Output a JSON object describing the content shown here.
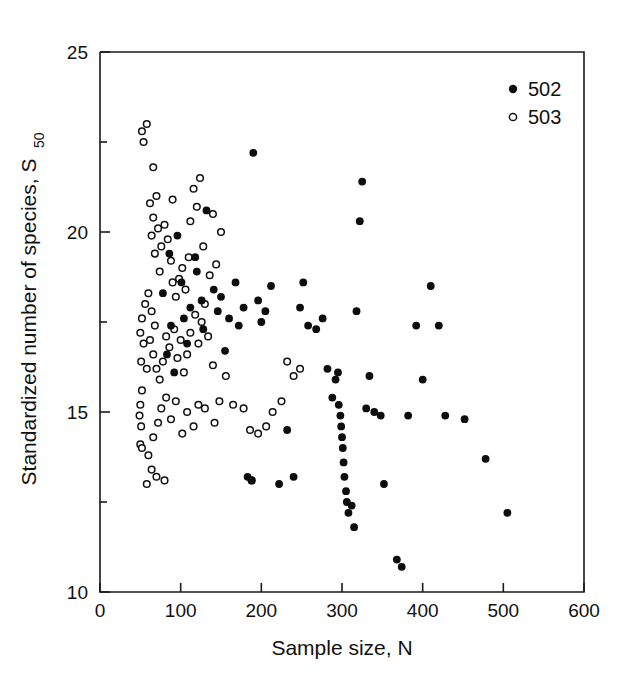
{
  "chart_data": {
    "type": "scatter",
    "title": "",
    "xlabel": "Sample size, N",
    "ylabel_main": "Standardized number of species, S",
    "ylabel_sub": "50",
    "xlim": [
      0,
      600
    ],
    "ylim": [
      10,
      25
    ],
    "xticks": [
      0,
      100,
      200,
      300,
      400,
      500,
      600
    ],
    "yticks": [
      10,
      15,
      20,
      25
    ],
    "yticks_minor": [
      12.5,
      17.5,
      22.5
    ],
    "grid": false,
    "legend_position": "top-right",
    "series": [
      {
        "name": "502",
        "marker": "filled-circle",
        "color": "#0d0d0d",
        "points": [
          [
            118,
            19.3
          ],
          [
            120,
            18.9
          ],
          [
            126,
            18.1
          ],
          [
            128,
            17.3
          ],
          [
            132,
            20.6
          ],
          [
            96,
            19.9
          ],
          [
            101,
            18.6
          ],
          [
            104,
            17.6
          ],
          [
            108,
            16.9
          ],
          [
            112,
            17.9
          ],
          [
            88,
            17.4
          ],
          [
            83,
            16.6
          ],
          [
            92,
            16.1
          ],
          [
            78,
            18.3
          ],
          [
            86,
            19.4
          ],
          [
            141,
            18.4
          ],
          [
            146,
            17.8
          ],
          [
            150,
            18.2
          ],
          [
            155,
            16.7
          ],
          [
            160,
            17.6
          ],
          [
            168,
            18.6
          ],
          [
            172,
            17.4
          ],
          [
            178,
            17.9
          ],
          [
            183,
            13.2
          ],
          [
            188,
            13.1
          ],
          [
            190,
            22.2
          ],
          [
            196,
            18.1
          ],
          [
            200,
            17.5
          ],
          [
            205,
            17.8
          ],
          [
            212,
            18.5
          ],
          [
            222,
            13.0
          ],
          [
            232,
            14.5
          ],
          [
            240,
            13.2
          ],
          [
            248,
            17.9
          ],
          [
            252,
            18.6
          ],
          [
            258,
            17.4
          ],
          [
            268,
            17.3
          ],
          [
            276,
            17.6
          ],
          [
            282,
            16.2
          ],
          [
            288,
            15.4
          ],
          [
            292,
            15.9
          ],
          [
            295,
            16.1
          ],
          [
            296,
            15.2
          ],
          [
            298,
            14.9
          ],
          [
            299,
            14.6
          ],
          [
            300,
            14.3
          ],
          [
            301,
            14.0
          ],
          [
            302,
            13.6
          ],
          [
            303,
            13.2
          ],
          [
            305,
            12.8
          ],
          [
            306,
            12.5
          ],
          [
            308,
            12.2
          ],
          [
            312,
            12.4
          ],
          [
            315,
            11.8
          ],
          [
            318,
            17.8
          ],
          [
            322,
            20.3
          ],
          [
            325,
            21.4
          ],
          [
            330,
            15.1
          ],
          [
            334,
            16.0
          ],
          [
            340,
            15.0
          ],
          [
            348,
            14.9
          ],
          [
            352,
            13.0
          ],
          [
            368,
            10.9
          ],
          [
            374,
            10.7
          ],
          [
            382,
            14.9
          ],
          [
            392,
            17.4
          ],
          [
            400,
            15.9
          ],
          [
            410,
            18.5
          ],
          [
            420,
            17.4
          ],
          [
            428,
            14.9
          ],
          [
            452,
            14.8
          ],
          [
            478,
            13.7
          ],
          [
            505,
            12.2
          ]
        ]
      },
      {
        "name": "503",
        "marker": "open-circle",
        "color": "#ffffff",
        "points": [
          [
            52,
            22.8
          ],
          [
            58,
            23.0
          ],
          [
            54,
            22.5
          ],
          [
            56,
            18.0
          ],
          [
            52,
            17.6
          ],
          [
            50,
            17.2
          ],
          [
            54,
            16.9
          ],
          [
            51,
            16.4
          ],
          [
            58,
            16.2
          ],
          [
            52,
            15.6
          ],
          [
            50,
            15.2
          ],
          [
            49,
            14.9
          ],
          [
            51,
            14.6
          ],
          [
            50,
            14.1
          ],
          [
            52,
            14.0
          ],
          [
            62,
            20.8
          ],
          [
            66,
            20.4
          ],
          [
            70,
            21.0
          ],
          [
            64,
            19.9
          ],
          [
            68,
            19.4
          ],
          [
            72,
            20.1
          ],
          [
            76,
            19.6
          ],
          [
            74,
            18.9
          ],
          [
            80,
            20.2
          ],
          [
            84,
            19.8
          ],
          [
            88,
            19.2
          ],
          [
            90,
            18.6
          ],
          [
            94,
            18.2
          ],
          [
            98,
            18.7
          ],
          [
            102,
            19.0
          ],
          [
            106,
            18.4
          ],
          [
            110,
            19.3
          ],
          [
            116,
            21.2
          ],
          [
            120,
            20.7
          ],
          [
            124,
            21.5
          ],
          [
            60,
            18.3
          ],
          [
            64,
            17.8
          ],
          [
            68,
            17.4
          ],
          [
            62,
            17.0
          ],
          [
            66,
            16.6
          ],
          [
            70,
            16.2
          ],
          [
            74,
            15.9
          ],
          [
            78,
            16.4
          ],
          [
            82,
            17.1
          ],
          [
            86,
            16.8
          ],
          [
            92,
            17.3
          ],
          [
            96,
            16.5
          ],
          [
            100,
            17.0
          ],
          [
            104,
            16.1
          ],
          [
            108,
            16.6
          ],
          [
            112,
            17.2
          ],
          [
            118,
            17.7
          ],
          [
            122,
            16.9
          ],
          [
            126,
            17.5
          ],
          [
            130,
            18.0
          ],
          [
            136,
            18.8
          ],
          [
            144,
            19.1
          ],
          [
            150,
            20.0
          ],
          [
            134,
            17.1
          ],
          [
            140,
            16.3
          ],
          [
            60,
            13.8
          ],
          [
            64,
            13.4
          ],
          [
            58,
            13.0
          ],
          [
            70,
            13.2
          ],
          [
            80,
            13.1
          ],
          [
            66,
            14.3
          ],
          [
            72,
            14.7
          ],
          [
            76,
            15.1
          ],
          [
            82,
            15.4
          ],
          [
            88,
            14.8
          ],
          [
            94,
            15.3
          ],
          [
            102,
            14.4
          ],
          [
            108,
            15.0
          ],
          [
            116,
            14.6
          ],
          [
            122,
            15.2
          ],
          [
            130,
            15.1
          ],
          [
            142,
            14.7
          ],
          [
            148,
            15.3
          ],
          [
            156,
            16.0
          ],
          [
            165,
            15.2
          ],
          [
            178,
            15.1
          ],
          [
            186,
            14.5
          ],
          [
            196,
            14.4
          ],
          [
            206,
            14.6
          ],
          [
            214,
            15.0
          ],
          [
            188,
            13.1
          ],
          [
            225,
            15.3
          ],
          [
            232,
            16.4
          ],
          [
            240,
            16.0
          ],
          [
            248,
            16.2
          ],
          [
            66,
            21.8
          ],
          [
            90,
            20.9
          ],
          [
            112,
            20.3
          ],
          [
            128,
            19.6
          ],
          [
            140,
            20.5
          ]
        ]
      }
    ]
  },
  "legend": {
    "entries": [
      {
        "label": "502",
        "marker": "filled-circle"
      },
      {
        "label": "503",
        "marker": "open-circle"
      }
    ]
  },
  "axis_text": {
    "x_title": "Sample size, N",
    "y_title": "Standardized number of species, S",
    "y_subscript": "50",
    "x_tick_labels": [
      "0",
      "100",
      "200",
      "300",
      "400",
      "500",
      "600"
    ],
    "y_tick_labels": [
      "10",
      "15",
      "20",
      "25"
    ]
  }
}
